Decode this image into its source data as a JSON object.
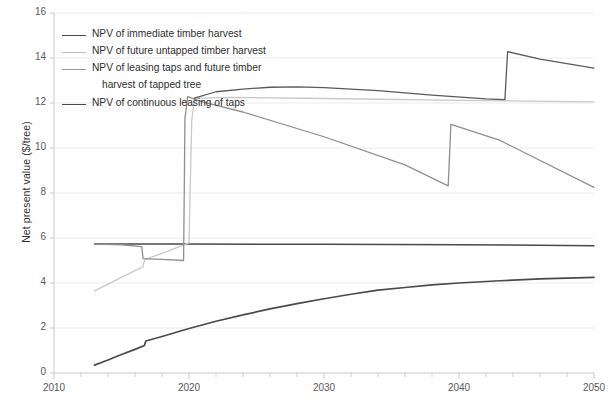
{
  "chart_data": {
    "type": "line",
    "title": "",
    "xlabel": "",
    "ylabel": "Net present value ($/tree)",
    "xlim": [
      2010,
      2050
    ],
    "ylim": [
      0,
      16
    ],
    "xticks": [
      2010,
      2020,
      2030,
      2040,
      2050
    ],
    "xtick_labels": [
      "2010",
      "2020",
      "2030",
      "2040",
      "2050"
    ],
    "x_minor_tick_step": 2,
    "yticks": [
      0,
      2,
      4,
      6,
      8,
      10,
      12,
      14,
      16
    ],
    "ytick_labels": [
      "0",
      "2",
      "4",
      "6",
      "8",
      "10",
      "12",
      "14",
      "16"
    ],
    "grid": "horizontal",
    "legend_position": "upper-left-inside",
    "series": [
      {
        "name": "NPV of immediate timber harvest",
        "color": "#4a4a4a",
        "width": 1.5,
        "points": [
          [
            2013,
            5.73
          ],
          [
            2020,
            5.73
          ],
          [
            2030,
            5.72
          ],
          [
            2040,
            5.7
          ],
          [
            2050,
            5.66
          ]
        ]
      },
      {
        "name": "NPV of future untapped timber harvest",
        "color": "#c8c8c8",
        "width": 1.3,
        "points": [
          [
            2013,
            3.65
          ],
          [
            2014,
            3.95
          ],
          [
            2015,
            4.25
          ],
          [
            2016,
            4.55
          ],
          [
            2016.6,
            4.72
          ],
          [
            2016.7,
            5.02
          ],
          [
            2017,
            5.1
          ],
          [
            2018,
            5.32
          ],
          [
            2019,
            5.55
          ],
          [
            2020,
            5.78
          ],
          [
            2020.2,
            11.2
          ],
          [
            2020.4,
            12.22
          ],
          [
            2021,
            12.22
          ],
          [
            2023,
            12.25
          ],
          [
            2030,
            12.2
          ],
          [
            2040,
            12.12
          ],
          [
            2050,
            12.05
          ]
        ]
      },
      {
        "name": "NPV of leasing taps and future timber harvest of tapped tree",
        "color": "#8f8f8f",
        "width": 1.3,
        "points": [
          [
            2013,
            5.73
          ],
          [
            2015,
            5.7
          ],
          [
            2016.5,
            5.62
          ],
          [
            2016.6,
            5.08
          ],
          [
            2018,
            5.05
          ],
          [
            2019.6,
            5.0
          ],
          [
            2019.7,
            11.3
          ],
          [
            2019.9,
            12.28
          ],
          [
            2021,
            12.05
          ],
          [
            2024,
            11.6
          ],
          [
            2030,
            10.5
          ],
          [
            2036,
            9.25
          ],
          [
            2039.2,
            8.32
          ],
          [
            2039.4,
            11.05
          ],
          [
            2043,
            10.35
          ],
          [
            2050,
            8.25
          ]
        ]
      },
      {
        "name": "NPV of continuous leasing of taps",
        "color": "#4a4a4a",
        "width": 1.7,
        "points": [
          [
            2013,
            0.35
          ],
          [
            2014,
            0.58
          ],
          [
            2015,
            0.82
          ],
          [
            2016,
            1.05
          ],
          [
            2016.7,
            1.22
          ],
          [
            2016.8,
            1.42
          ],
          [
            2018,
            1.62
          ],
          [
            2020,
            1.98
          ],
          [
            2022,
            2.3
          ],
          [
            2024,
            2.58
          ],
          [
            2026,
            2.85
          ],
          [
            2028,
            3.08
          ],
          [
            2030,
            3.3
          ],
          [
            2032,
            3.5
          ],
          [
            2034,
            3.68
          ],
          [
            2036,
            3.8
          ],
          [
            2038,
            3.92
          ],
          [
            2040,
            4.0
          ],
          [
            2043,
            4.1
          ],
          [
            2046,
            4.18
          ],
          [
            2050,
            4.25
          ]
        ]
      },
      {
        "name": "NPV of future untapped timber harvest (upper branch)",
        "color": "#5a5a5a",
        "width": 1.3,
        "points": [
          [
            2020.4,
            12.22
          ],
          [
            2022,
            12.5
          ],
          [
            2024,
            12.62
          ],
          [
            2026,
            12.7
          ],
          [
            2028,
            12.72
          ],
          [
            2030,
            12.68
          ],
          [
            2034,
            12.55
          ],
          [
            2038,
            12.35
          ],
          [
            2042,
            12.18
          ],
          [
            2043.4,
            12.15
          ],
          [
            2043.6,
            14.28
          ],
          [
            2046,
            13.95
          ],
          [
            2050,
            13.55
          ]
        ]
      }
    ]
  },
  "legend": {
    "items": [
      {
        "label": "NPV of immediate timber harvest",
        "color": "#4a4a4a",
        "width": 1.8
      },
      {
        "label": "NPV of future untapped timber harvest",
        "color": "#c0c0c0",
        "width": 1.4
      },
      {
        "label": "NPV of leasing taps and future timber",
        "color": "#9a9a9a",
        "width": 1.4
      },
      {
        "label": "NPV of continuous leasing of taps",
        "color": "#4a4a4a",
        "width": 1.8
      }
    ],
    "continuation_line": "harvest of tapped tree"
  },
  "axes": {
    "y_title": "Net present value ($/tree)"
  },
  "style": {
    "grid_color": "#ebebeb",
    "axis_color": "#c9c9c9",
    "tick_text_color": "#5a5a5a"
  }
}
